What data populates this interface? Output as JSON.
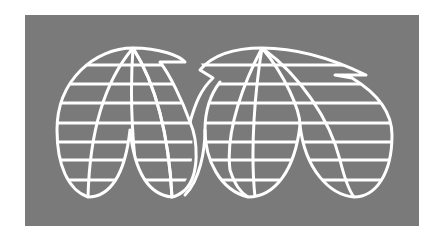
{
  "image": {
    "description": "Logo: two interlocking globe wireframes forming a stylized 'M' shape, white lines on a gray rectangle",
    "colors": {
      "background": "#ffffff",
      "panel": "#7a7a7a",
      "lines": "#ffffff"
    },
    "icon": "globe-grid-m-logo"
  }
}
